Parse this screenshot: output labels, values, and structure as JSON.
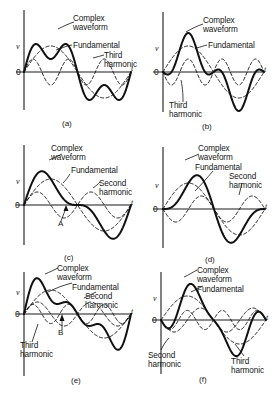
{
  "figure": {
    "background": "#ffffff",
    "ink": "#111111"
  },
  "axis_labels": {
    "v": "v",
    "t": "t",
    "zero": "0"
  },
  "panels": [
    {
      "id": "a",
      "caption": "(a)",
      "labels": [
        "Complex\nwaveform",
        "Fundamental",
        "Third\nharmonic"
      ],
      "label_complex": "Complex",
      "label_waveform": "waveform",
      "label_fundamental": "Fundamental",
      "label_third1": "Third",
      "label_third2": "harmonic",
      "markers": []
    },
    {
      "id": "b",
      "caption": "(b)",
      "labels": [
        "Complex\nwaveform",
        "Fundamental",
        "Third\nharmonic"
      ],
      "label_complex": "Complex",
      "label_waveform": "waveform",
      "label_fundamental": "Fundamental",
      "label_third1": "Third",
      "label_third2": "harmonic",
      "markers": []
    },
    {
      "id": "c",
      "caption": "(c)",
      "labels": [
        "Complex\nwaveform",
        "Fundamental",
        "Second\nharmonic"
      ],
      "label_complex": "Complex",
      "label_waveform": "waveform",
      "label_fundamental": "Fundamental",
      "label_second1": "Second",
      "label_second2": "harmonic",
      "markers": [
        "A"
      ]
    },
    {
      "id": "d",
      "caption": "(d)",
      "labels": [
        "Complex\nwaveform",
        "Fundamental",
        "Second\nharmonic"
      ],
      "label_complex": "Complex",
      "label_waveform": "waveform",
      "label_fundamental": "Fundamental",
      "label_second1": "Second",
      "label_second2": "harmonic",
      "markers": []
    },
    {
      "id": "e",
      "caption": "(e)",
      "labels": [
        "Complex\nwaveform",
        "Fundamental",
        "Second\nharmonic",
        "Third\nharmonic"
      ],
      "label_complex": "Complex",
      "label_waveform": "waveform",
      "label_fundamental": "Fundamental",
      "label_second1": "Second",
      "label_second2": "harmonic",
      "label_third1": "Third",
      "label_third2": "harmonic",
      "markers": [
        "B"
      ]
    },
    {
      "id": "f",
      "caption": "(f)",
      "labels": [
        "Complex\nwaveform",
        "Fundamental",
        "Second\nharmonic",
        "Third\nharmonic"
      ],
      "label_complex": "Complex",
      "label_waveform": "waveform",
      "label_fundamental": "Fundamental",
      "label_second1": "Second",
      "label_second2": "harmonic",
      "label_third1": "Third",
      "label_third2": "harmonic",
      "markers": []
    }
  ],
  "chart_data": {
    "type": "line",
    "xlabel": "t",
    "ylabel": "v",
    "grid": false,
    "legend_position": "inline-annotations",
    "xlim": [
      0,
      6.2832
    ],
    "ylim": [
      -2.2,
      2.2
    ],
    "panels": [
      {
        "id": "a",
        "caption": "(a)",
        "description": "Fundamental plus third harmonic in phase",
        "series": [
          {
            "name": "Fundamental",
            "style": "dashed",
            "harmonic": 1,
            "amplitude": 1.0,
            "phase_deg": 0
          },
          {
            "name": "Third harmonic",
            "style": "dashed",
            "harmonic": 3,
            "amplitude": 0.5,
            "phase_deg": 0
          },
          {
            "name": "Complex waveform",
            "style": "solid",
            "sum_of": [
              "Fundamental",
              "Third harmonic"
            ]
          }
        ]
      },
      {
        "id": "b",
        "caption": "(b)",
        "description": "Fundamental plus third harmonic antiphase (180 deg)",
        "series": [
          {
            "name": "Fundamental",
            "style": "dashed",
            "harmonic": 1,
            "amplitude": 1.0,
            "phase_deg": 0
          },
          {
            "name": "Third harmonic",
            "style": "dashed",
            "harmonic": 3,
            "amplitude": 0.5,
            "phase_deg": 180
          },
          {
            "name": "Complex waveform",
            "style": "solid",
            "sum_of": [
              "Fundamental",
              "Third harmonic"
            ]
          }
        ]
      },
      {
        "id": "c",
        "caption": "(c)",
        "description": "Fundamental plus second harmonic in phase; point A at zero crossing",
        "annotations": [
          {
            "label": "A",
            "x": 3.1416,
            "y": 0
          }
        ],
        "series": [
          {
            "name": "Fundamental",
            "style": "dashed",
            "harmonic": 1,
            "amplitude": 1.0,
            "phase_deg": 0
          },
          {
            "name": "Second harmonic",
            "style": "dashed",
            "harmonic": 2,
            "amplitude": 0.5,
            "phase_deg": 0
          },
          {
            "name": "Complex waveform",
            "style": "solid",
            "sum_of": [
              "Fundamental",
              "Second harmonic"
            ]
          }
        ]
      },
      {
        "id": "d",
        "caption": "(d)",
        "description": "Fundamental plus second harmonic antiphase (180 deg)",
        "series": [
          {
            "name": "Fundamental",
            "style": "dashed",
            "harmonic": 1,
            "amplitude": 1.0,
            "phase_deg": 0
          },
          {
            "name": "Second harmonic",
            "style": "dashed",
            "harmonic": 2,
            "amplitude": 0.5,
            "phase_deg": 180
          },
          {
            "name": "Complex waveform",
            "style": "solid",
            "sum_of": [
              "Fundamental",
              "Second harmonic"
            ]
          }
        ]
      },
      {
        "id": "e",
        "caption": "(e)",
        "description": "Fundamental plus second and third harmonics in phase; point B at zero crossing",
        "annotations": [
          {
            "label": "B",
            "x": 3.1416,
            "y": 0
          }
        ],
        "series": [
          {
            "name": "Fundamental",
            "style": "dashed",
            "harmonic": 1,
            "amplitude": 1.0,
            "phase_deg": 0
          },
          {
            "name": "Second harmonic",
            "style": "dashed",
            "harmonic": 2,
            "amplitude": 0.5,
            "phase_deg": 0
          },
          {
            "name": "Third harmonic",
            "style": "dashed",
            "harmonic": 3,
            "amplitude": 0.4,
            "phase_deg": 0
          },
          {
            "name": "Complex waveform",
            "style": "solid",
            "sum_of": [
              "Fundamental",
              "Second harmonic",
              "Third harmonic"
            ]
          }
        ]
      },
      {
        "id": "f",
        "caption": "(f)",
        "description": "Fundamental plus second and third harmonics, harmonics antiphase",
        "series": [
          {
            "name": "Fundamental",
            "style": "dashed",
            "harmonic": 1,
            "amplitude": 1.0,
            "phase_deg": 0
          },
          {
            "name": "Second harmonic",
            "style": "dashed",
            "harmonic": 2,
            "amplitude": 0.5,
            "phase_deg": 180
          },
          {
            "name": "Third harmonic",
            "style": "dashed",
            "harmonic": 3,
            "amplitude": 0.4,
            "phase_deg": 180
          },
          {
            "name": "Complex waveform",
            "style": "solid",
            "sum_of": [
              "Fundamental",
              "Second harmonic",
              "Third harmonic"
            ]
          }
        ]
      }
    ]
  }
}
